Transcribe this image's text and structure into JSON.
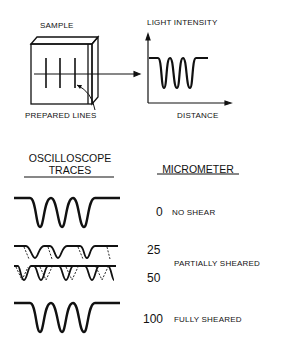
{
  "top": {
    "sample_label": "SAMPLE",
    "prepared_lines_label": "PREPARED LINES",
    "light_intensity_label": "LIGHT INTENSITY",
    "distance_label": "DISTANCE"
  },
  "headers": {
    "oscilloscope_line1": "OSCILLOSCOPE",
    "oscilloscope_line2": "TRACES",
    "micrometer": "MICROMETER"
  },
  "rows": [
    {
      "value": "0",
      "desc": "NO SHEAR"
    },
    {
      "value": "25",
      "desc": ""
    },
    {
      "value": "50",
      "desc": ""
    },
    {
      "value": "100",
      "desc": "FULLY SHEARED"
    }
  ],
  "group_label": "PARTIALLY SHEARED"
}
